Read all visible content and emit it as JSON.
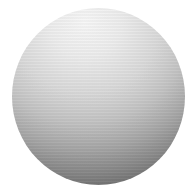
{
  "image": {
    "subject": "shaded sphere",
    "background_color": "#ffffff",
    "sphere": {
      "highlight_color": "#f7f7f7",
      "shadow_color": "#4e4e4e",
      "light_direction": "top"
    }
  }
}
